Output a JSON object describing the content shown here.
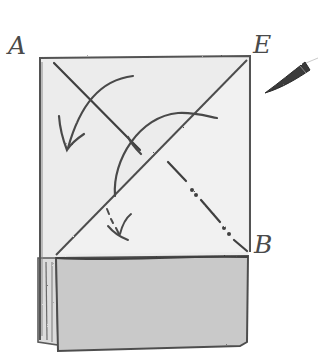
{
  "diagram": {
    "type": "origami-fold-step",
    "labels": {
      "point_a": "A",
      "point_e": "E",
      "point_b": "B"
    },
    "colors": {
      "paper_light": "#ececec",
      "paper_dark": "#c9c9c9",
      "stroke": "#4d4d4d",
      "background": "#ffffff"
    },
    "elements": {
      "paper_sheet": "Rectangular folded paper",
      "valley_fold_line": "Diagonal from A toward B (dash-dot in lower half)",
      "mountain_edge": "Diagonal edge from E down to left side",
      "fold_arrow_large": "Curved arrow from top toward lower-left",
      "fold_arrow_arc": "Arc arrow crossing the diagonals",
      "fold_arrow_small": "Small dashed checkmark arrow",
      "bottom_flap": "Gray folded band at bottom",
      "pencil_tip": "Dark pencil tip pointing at E"
    }
  }
}
